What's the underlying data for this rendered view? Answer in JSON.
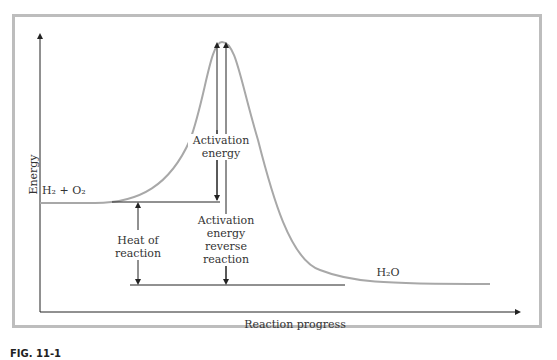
{
  "diagram": {
    "y_axis_label": "Energy",
    "x_axis_label": "Reaction progress",
    "reactants_label": "H₂ + O₂",
    "product_label": "H₂O",
    "activation_energy_label": [
      "Activation",
      "energy"
    ],
    "heat_of_reaction_label": [
      "Heat of",
      "reaction"
    ],
    "reverse_activation_label": [
      "Activation",
      "energy",
      "reverse",
      "reaction"
    ],
    "figure_caption": "FIG. 11-1"
  },
  "colors": {
    "curve": "#a8a8a8",
    "lines": "#333333",
    "frame": "#bdbdbd"
  }
}
